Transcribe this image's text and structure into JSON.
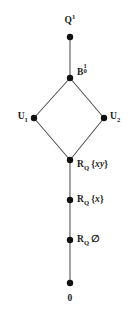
{
  "figure": {
    "kind": "hasse-diagram",
    "background_color": "#ffffff",
    "edge_color": "#555555",
    "node_color": "#111111",
    "text_color": "#1a1a1a",
    "node_radius": 3.2,
    "edge_width": 1.1,
    "width": 137,
    "height": 315
  },
  "nodes": [
    {
      "id": "top",
      "label_plain": "Q^1",
      "base": "Q",
      "sup": "1",
      "sub": "",
      "suffix": "",
      "x": 70,
      "y": 37,
      "label_x": 70,
      "label_y": 20,
      "label_align": "center"
    },
    {
      "id": "b01",
      "label_plain": "B_0^1",
      "base": "B",
      "sup": "1",
      "sub": "0",
      "suffix": "",
      "x": 70,
      "y": 78,
      "label_x": 77,
      "label_y": 71,
      "label_align": "right"
    },
    {
      "id": "u1",
      "label_plain": "U_1",
      "base": "U",
      "sup": "",
      "sub": "1",
      "suffix": "",
      "x": 34,
      "y": 118,
      "label_x": 28,
      "label_y": 118,
      "label_align": "left"
    },
    {
      "id": "u2",
      "label_plain": "U_2",
      "base": "U",
      "sup": "",
      "sub": "2",
      "suffix": "",
      "x": 104,
      "y": 118,
      "label_x": 110,
      "label_y": 118,
      "label_align": "right"
    },
    {
      "id": "rq-xy",
      "label_plain": "R_Q {xy}",
      "base": "R",
      "sup": "",
      "sub": "Q",
      "suffix": "{xy}",
      "x": 70,
      "y": 160,
      "label_x": 77,
      "label_y": 166,
      "label_align": "right"
    },
    {
      "id": "rq-x",
      "label_plain": "R_Q {x}",
      "base": "R",
      "sup": "",
      "sub": "Q",
      "suffix": "{x}",
      "x": 70,
      "y": 200,
      "label_x": 77,
      "label_y": 201,
      "label_align": "right"
    },
    {
      "id": "rq-empty",
      "label_plain": "R_Q ∅",
      "base": "R",
      "sup": "",
      "sub": "Q",
      "suffix": "∅",
      "x": 70,
      "y": 240,
      "label_x": 77,
      "label_y": 241,
      "label_align": "right"
    },
    {
      "id": "bottom",
      "label_plain": "0",
      "base": "0",
      "sup": "",
      "sub": "",
      "suffix": "",
      "x": 70,
      "y": 283,
      "label_x": 70,
      "label_y": 299,
      "label_align": "center"
    }
  ],
  "edges": [
    {
      "from": "top",
      "to": "b01",
      "x1": 70,
      "y1": 37,
      "x2": 70,
      "y2": 78
    },
    {
      "from": "b01",
      "to": "u1",
      "x1": 70,
      "y1": 78,
      "x2": 34,
      "y2": 118
    },
    {
      "from": "b01",
      "to": "u2",
      "x1": 70,
      "y1": 78,
      "x2": 104,
      "y2": 118
    },
    {
      "from": "u1",
      "to": "rq-xy",
      "x1": 34,
      "y1": 118,
      "x2": 70,
      "y2": 160
    },
    {
      "from": "u2",
      "to": "rq-xy",
      "x1": 104,
      "y1": 118,
      "x2": 70,
      "y2": 160
    },
    {
      "from": "rq-xy",
      "to": "rq-x",
      "x1": 70,
      "y1": 160,
      "x2": 70,
      "y2": 200
    },
    {
      "from": "rq-x",
      "to": "rq-empty",
      "x1": 70,
      "y1": 200,
      "x2": 70,
      "y2": 240
    },
    {
      "from": "rq-empty",
      "to": "bottom",
      "x1": 70,
      "y1": 240,
      "x2": 70,
      "y2": 283
    }
  ]
}
